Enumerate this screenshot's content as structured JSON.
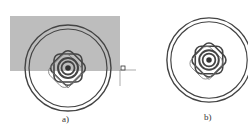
{
  "figures": [
    {
      "id": "a",
      "label": "a)",
      "center": [
        68,
        68
      ],
      "outer_r": 43,
      "inner_r": 39,
      "has_selection_window": true
    },
    {
      "id": "b",
      "label": "b)",
      "center": [
        209,
        60
      ],
      "outer_r": 42,
      "inner_r": 38,
      "has_selection_window": false
    }
  ],
  "selection_window": {
    "x": 10,
    "y": 16,
    "width": 110,
    "height": 55,
    "fill": "#bdbdbd"
  },
  "grip": {
    "x": 123,
    "y": 68,
    "size": 4
  },
  "colors": {
    "stroke": "#444444",
    "selection_fill": "#bdbdbd"
  }
}
